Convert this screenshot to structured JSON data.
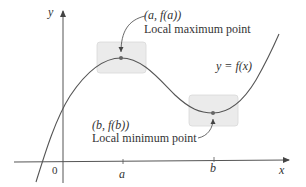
{
  "figure": {
    "axes": {
      "x_label": "x",
      "y_label": "y",
      "origin_label": "0",
      "ticks": [
        {
          "label": "a"
        },
        {
          "label": "b"
        }
      ]
    },
    "curve": {
      "label": "y = f(x)"
    },
    "maximum": {
      "coord_label": "(a, f(a))",
      "description": "Local maximum point"
    },
    "minimum": {
      "coord_label": "(b, f(b))",
      "description": "Local minimum point"
    },
    "colors": {
      "curve": "#555555",
      "axes": "#555555",
      "highlight_box": "#ebebeb",
      "highlight_border": "#d6d6d6",
      "point": "#666666",
      "text": "#333333"
    }
  }
}
